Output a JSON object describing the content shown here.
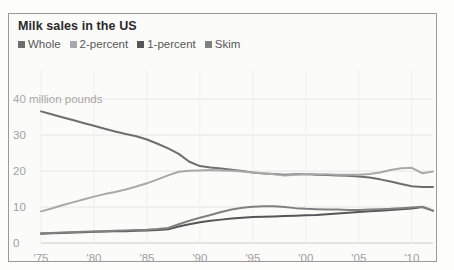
{
  "panel": {
    "title": "Milk sales in the US"
  },
  "legend": {
    "position": "top-left",
    "items": [
      {
        "label": "Whole",
        "color": "#6e6e6e",
        "swatch_icon": "square-swatch-icon"
      },
      {
        "label": "2-percent",
        "color": "#a9a9a9",
        "swatch_icon": "square-swatch-icon"
      },
      {
        "label": "1-percent",
        "color": "#565656",
        "swatch_icon": "square-swatch-icon"
      },
      {
        "label": "Skim",
        "color": "#808080",
        "swatch_icon": "square-swatch-icon"
      }
    ]
  },
  "axis": {
    "y_unit_label": "40 million pounds",
    "y_ticks": [
      "40",
      "30",
      "20",
      "10",
      "0"
    ],
    "x_ticks": [
      "'75",
      "'80",
      "'85",
      "'90",
      "'95",
      "'00",
      "'05",
      "'10"
    ]
  },
  "chart_data": {
    "type": "line",
    "title": "Milk sales in the US",
    "xlabel": "",
    "ylabel": "40 million pounds",
    "ylim": [
      0,
      42
    ],
    "xlim": [
      1975,
      2012
    ],
    "grid": true,
    "grid_axis": "y",
    "legend_position": "top-left",
    "y_tick_values": [
      0,
      10,
      20,
      30,
      40
    ],
    "x_tick_values": [
      1975,
      1980,
      1985,
      1990,
      1995,
      2000,
      2005,
      2010
    ],
    "x_tick_labels": [
      "'75",
      "'80",
      "'85",
      "'90",
      "'95",
      "'00",
      "'05",
      "'10"
    ],
    "x": [
      1975,
      1976,
      1977,
      1978,
      1979,
      1980,
      1981,
      1982,
      1983,
      1984,
      1985,
      1986,
      1987,
      1988,
      1989,
      1990,
      1991,
      1992,
      1993,
      1994,
      1995,
      1996,
      1997,
      1998,
      1999,
      2000,
      2001,
      2002,
      2003,
      2004,
      2005,
      2006,
      2007,
      2008,
      2009,
      2010,
      2011,
      2012
    ],
    "series": [
      {
        "name": "Whole",
        "color": "#6e6e6e",
        "units": "million pounds",
        "values": [
          36.6,
          35.8,
          35.0,
          34.2,
          33.4,
          32.6,
          31.8,
          31.0,
          30.3,
          29.7,
          28.8,
          27.6,
          26.3,
          24.8,
          22.6,
          21.4,
          21.0,
          20.7,
          20.4,
          20.0,
          19.6,
          19.3,
          19.2,
          19.0,
          19.1,
          19.2,
          19.0,
          18.9,
          18.8,
          18.7,
          18.5,
          18.2,
          17.7,
          17.1,
          16.4,
          15.8,
          15.6,
          15.6
        ]
      },
      {
        "name": "2-percent",
        "color": "#a9a9a9",
        "units": "million pounds",
        "values": [
          8.8,
          9.6,
          10.5,
          11.3,
          12.1,
          12.9,
          13.6,
          14.2,
          14.9,
          15.7,
          16.6,
          17.7,
          18.8,
          19.8,
          20.1,
          20.2,
          20.3,
          20.2,
          20.1,
          19.9,
          19.6,
          19.4,
          19.1,
          18.8,
          19.0,
          19.2,
          19.1,
          19.1,
          19.0,
          19.0,
          19.0,
          19.2,
          19.6,
          20.3,
          20.8,
          20.9,
          19.4,
          19.9
        ]
      },
      {
        "name": "1-percent",
        "color": "#565656",
        "units": "million pounds",
        "values": [
          2.6,
          2.7,
          2.8,
          2.9,
          3.0,
          3.1,
          3.2,
          3.3,
          3.3,
          3.4,
          3.5,
          3.6,
          3.8,
          4.6,
          5.2,
          5.8,
          6.2,
          6.5,
          6.8,
          7.0,
          7.2,
          7.3,
          7.4,
          7.5,
          7.6,
          7.7,
          7.8,
          8.0,
          8.2,
          8.4,
          8.6,
          8.8,
          9.0,
          9.2,
          9.4,
          9.6,
          10.0,
          9.0
        ]
      },
      {
        "name": "Skim",
        "color": "#808080",
        "units": "million pounds",
        "values": [
          2.7,
          2.8,
          2.9,
          3.0,
          3.1,
          3.2,
          3.3,
          3.4,
          3.5,
          3.6,
          3.7,
          3.9,
          4.2,
          5.2,
          6.2,
          7.0,
          7.8,
          8.6,
          9.3,
          9.8,
          10.1,
          10.2,
          10.2,
          10.0,
          9.7,
          9.5,
          9.4,
          9.3,
          9.3,
          9.2,
          9.2,
          9.3,
          9.4,
          9.5,
          9.7,
          9.9,
          10.1,
          9.0
        ]
      }
    ]
  }
}
